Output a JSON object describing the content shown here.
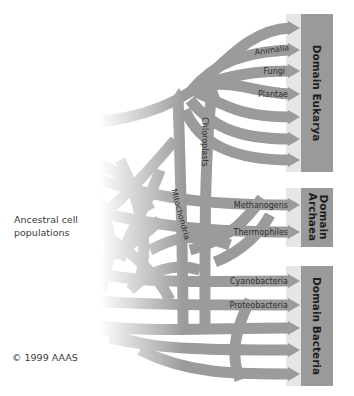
{
  "diagram": {
    "left_label": [
      "Ancestral cell",
      "populations"
    ],
    "copyright": "© 1999 AAAS",
    "colors": {
      "branch": "#9b9b9b",
      "branch_edge": "#e8e8e8",
      "domain_box": "#9a9a9a",
      "domain_band": "#e6e6e6",
      "text": "#3a3a3a",
      "domain_text": "#1e1e1e"
    },
    "domains": [
      {
        "label": "Domain Eukarya",
        "lines": [
          "Domain Eukarya"
        ]
      },
      {
        "label": "Domain Archaea",
        "lines": [
          "Domain",
          "Archaea"
        ]
      },
      {
        "label": "Domain Bacteria",
        "lines": [
          "Domain Bacteria"
        ]
      }
    ],
    "lineage_labels": {
      "animalia": "Animalia",
      "fungi": "Fungi",
      "plantae": "Plantae",
      "methanogens": "Methanogens",
      "thermophiles": "Thermophiles",
      "cyanobacteria": "Cyanobacteria",
      "proteobacteria": "Proteobacteria"
    },
    "endosymbiosis_labels": {
      "mitochondria": "Mitochondria",
      "chloroplasts": "Chloroplasts"
    }
  }
}
